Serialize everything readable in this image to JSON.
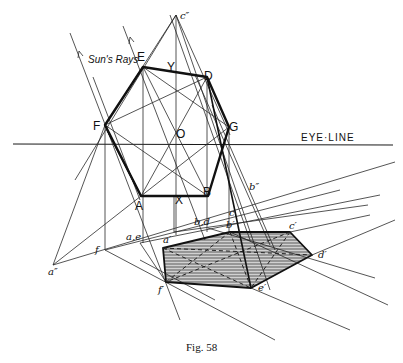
{
  "figure": {
    "caption": "Fig. 58",
    "eye_line_label": "EYE·LINE",
    "sun_rays_label": "Sun's Rays"
  },
  "labels": {
    "E": "E",
    "D": "D",
    "G": "G",
    "B": "B",
    "A": "A",
    "F": "F",
    "O": "O",
    "X": "X",
    "Y": "Y",
    "c_dd": "c″",
    "a_dd": "a″",
    "b_dd": "b″",
    "f": "f",
    "ae": "a,e",
    "bd": "b,d",
    "c": "c",
    "a_p": "a′",
    "b_p": "b′",
    "c_p": "c′",
    "d_p": "d′",
    "e_p": "e′",
    "f_p": "f′"
  },
  "colors": {
    "ink": "#111111",
    "background": "#ffffff",
    "shadow_hatch": "#333333"
  }
}
